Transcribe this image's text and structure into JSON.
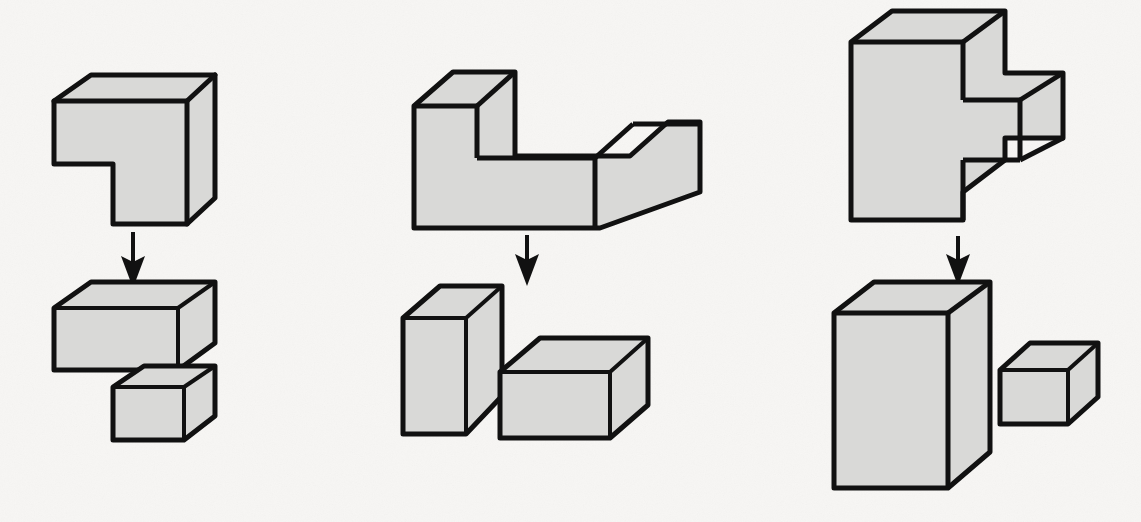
{
  "figure": {
    "canvas": {
      "width": 1141,
      "height": 522
    },
    "style": {
      "background_color": "#f7f6f4",
      "face_fill_color": "#d9d9d7",
      "outline_color": "#111111",
      "arrow_color": "#111111",
      "outline_width": 5,
      "inner_edge_width": 3
    },
    "columns": [
      {
        "id": "column-1",
        "name": "L-shaped corner block",
        "arrow": {
          "label": "decomposes-into",
          "x": 133,
          "y_start": 232,
          "y_end": 286
        },
        "composite": {
          "name": "l-corner-solid",
          "outline": "54,101 91,75 215,75 215,198 187,224 113,224 113,164 54,164",
          "inner_edges": [
            "54,101 187,101",
            "187,101 187,224",
            "187,101 215,75"
          ]
        },
        "pieces": [
          {
            "name": "wide-flat-slab",
            "outline": "54,308 91,282 215,282 215,343 178,370 54,370",
            "inner_edges": [
              "54,308 178,308",
              "178,308 178,370",
              "178,308 215,282"
            ]
          },
          {
            "name": "small-cube-block",
            "outline": "113,387 144,366 215,366 215,416 184,440 113,440",
            "inner_edges": [
              "113,387 184,387",
              "184,387 184,440",
              "184,387 215,366"
            ]
          }
        ]
      },
      {
        "id": "column-2",
        "name": "L-shaped step block",
        "arrow": {
          "label": "decomposes-into",
          "x": 527,
          "y_start": 233,
          "y_end": 285
        },
        "composite": {
          "name": "l-step-solid",
          "outline": "414,106 453,72 515,72 515,156 633,156 633,121 634,121 636,121 636,121 633,121 633,156 633,156 636,156 636,156 633,156",
          "outline_real": "414,106 453,72 515,72 515,156 630,156 630,120 633,120 633,121 630,121 630,156",
          "path": "M414,106 L453,72 L515,72 L515,156 L630,156 L668,122 L700,122 L700,206 L598,242 L414,242 Z",
          "inner_edges": [
            "414,106 515,106",
            "515,106 515,156",
            "515,106 553,72",
            "630,156 598,190",
            "598,190 598,242",
            "598,190 700,190",
            "630,156 700,156"
          ]
        },
        "pieces": [
          {
            "name": "tall-upright-block",
            "outline": "403,318 440,286 502,286 502,396 466,434 403,434",
            "inner_edges": [
              "403,318 466,318",
              "466,318 466,434",
              "466,318 502,286"
            ]
          },
          {
            "name": "wide-low-block",
            "outline": "500,372 540,338 648,338 648,405 610,438 500,438",
            "inner_edges": [
              "500,372 610,372",
              "610,372 610,438",
              "610,372 648,338"
            ]
          }
        ]
      },
      {
        "id": "column-3",
        "name": "Notched tall block",
        "arrow": {
          "label": "decomposes-into",
          "x": 958,
          "y_start": 234,
          "y_end": 285
        },
        "composite": {
          "name": "notched-tall-solid",
          "path": "M852,42 L893,11 L1005,11 L1005,72 L1063,72 L1063,143 L1005,143 L1005,193 L1005,193 L1005,193 L1005,193 L1005,193 L1005,193 Z",
          "inner_edges": []
        },
        "pieces": [
          {
            "name": "large-tall-block",
            "outline": "834,313 874,282 990,282 990,452 948,488 834,488",
            "inner_edges": [
              "834,313 948,313",
              "948,313 948,488",
              "948,313 990,282"
            ]
          },
          {
            "name": "small-side-block",
            "outline": "1000,370 1030,343 1098,343 1098,397 1068,424 1000,424",
            "inner_edges": [
              "1000,370 1068,370",
              "1068,370 1068,424",
              "1068,370 1098,343"
            ]
          }
        ]
      }
    ]
  }
}
